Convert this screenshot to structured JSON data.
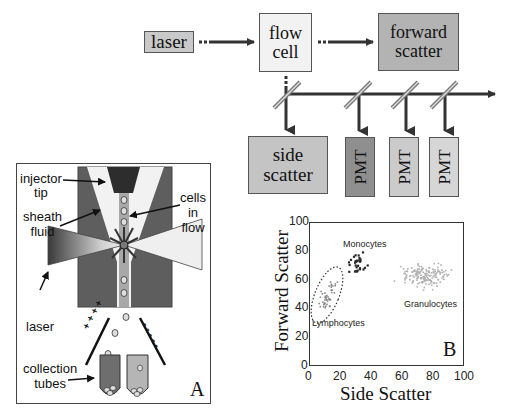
{
  "flowchart": {
    "laser": {
      "label": "laser",
      "color": "#c9c9c9"
    },
    "flow_cell": {
      "line1": "flow",
      "line2": "cell",
      "color": "#f2f2f2"
    },
    "forward_scatter": {
      "line1": "forward",
      "line2": "scatter",
      "color": "#b3b3b3"
    },
    "side_scatter": {
      "line1": "side",
      "line2": "scatter",
      "color": "#c4c4c4"
    },
    "pmts": [
      {
        "label": "PMT",
        "color": "#8f8f8f"
      },
      {
        "label": "PMT",
        "color": "#cbcbcb"
      },
      {
        "label": "PMT",
        "color": "#d6d6d6"
      }
    ]
  },
  "panel_a": {
    "letter": "A",
    "labels": {
      "injector_tip_1": "injector",
      "injector_tip_2": "tip",
      "sheath_fluid_1": "sheath",
      "sheath_fluid_2": "fluid",
      "cells_in_flow_1": "cells",
      "cells_in_flow_2": "in",
      "cells_in_flow_3": "flow",
      "laser": "laser",
      "collection_tubes_1": "collection",
      "collection_tubes_2": "tubes",
      "positive_plate": "+ + + +",
      "negative_plate": "- - - - -"
    }
  },
  "panel_b": {
    "letter": "B",
    "labels": {
      "monocytes": "Monocytes",
      "lymphocytes": "Lymphocytes",
      "granulocytes": "Granulocytes"
    }
  },
  "chart_data": {
    "type": "scatter",
    "title": "",
    "xlabel": "Side Scatter",
    "ylabel": "Forward Scatter",
    "xlim": [
      0,
      100
    ],
    "ylim": [
      0,
      100
    ],
    "xticks": [
      "0",
      "20",
      "40",
      "60",
      "80",
      "100"
    ],
    "yticks": [
      "0",
      "20",
      "40",
      "60",
      "80",
      "100"
    ],
    "grid": false,
    "series": [
      {
        "name": "Lymphocytes",
        "color": "#8a8a8a",
        "center": [
          12,
          50
        ],
        "spread": [
          6,
          8
        ],
        "count": 45
      },
      {
        "name": "Monocytes",
        "color": "#2a2a2a",
        "center": [
          31,
          71
        ],
        "spread": [
          4,
          5
        ],
        "count": 30
      },
      {
        "name": "Granulocytes",
        "color": "#b0b0b0",
        "center": [
          76,
          63
        ],
        "spread": [
          11,
          5
        ],
        "count": 160
      }
    ],
    "annotations": [
      {
        "text": "Monocytes",
        "x": 34,
        "y": 87
      },
      {
        "text": "Lymphocytes",
        "x": 18,
        "y": 31
      },
      {
        "text": "Granulocytes",
        "x": 78,
        "y": 43
      },
      {
        "text": "B",
        "x": 93,
        "y": 12
      }
    ]
  }
}
